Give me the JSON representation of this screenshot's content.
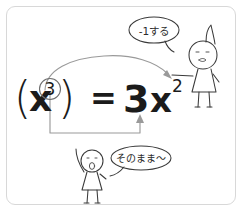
{
  "figure": {
    "background_color": "#ffffff",
    "border_color": "#d8d8d8",
    "ink_color": "#3a3a3a",
    "guide_color": "#9a9a9a"
  },
  "equation": {
    "full": "(x³) = 3x²",
    "left": {
      "open_paren": "(",
      "base": "x",
      "exponent": "3",
      "close_paren": ")",
      "exponent_circled": true
    },
    "equals": "=",
    "right": {
      "coefficient": "3",
      "base": "x",
      "exponent": "2"
    }
  },
  "annotations": [
    {
      "id": "top",
      "bubble_text": "-1する",
      "meaning_label": "subtract one from the exponent",
      "arrow": "curved-arrow-exponent-to-exponent",
      "character": "character-with-pointed-hat"
    },
    {
      "id": "bottom",
      "bubble_text": "そのまま〜",
      "meaning_label": "bring the exponent down unchanged",
      "arrow": "elbow-arrow-exponent-to-coefficient",
      "character": "character-with-raised-arm"
    }
  ]
}
